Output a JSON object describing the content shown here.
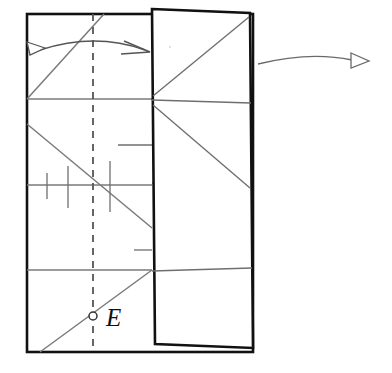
{
  "figure": {
    "type": "crease-pattern-fold-diagram",
    "background_color": "#ffffff",
    "line_color_heavy": "#111111",
    "line_color_light": "#7a7a7a",
    "arrow_color": "#555555"
  },
  "labels": {
    "point_E": "E"
  },
  "points": [
    {
      "name": "E",
      "label": "E",
      "marker": "open-circle",
      "x": 93,
      "y": 316,
      "radius": 4,
      "fill": "#ffffff",
      "stroke": "#333333",
      "label_x": 106,
      "label_y": 325
    }
  ],
  "shapes": {
    "main_rectangle": {
      "name": "base-sheet",
      "x": 27,
      "y": 14,
      "width": 226,
      "height": 338,
      "stroke_width": 2.6,
      "stroke": "#111111",
      "fill": "#ffffff"
    },
    "flap_panel": {
      "name": "folded-flap",
      "stroke_width": 2.6,
      "stroke": "#111111",
      "fill": "#ffffff",
      "corners": [
        {
          "x": 152,
          "y": 9
        },
        {
          "x": 250,
          "y": 13
        },
        {
          "x": 253,
          "y": 348
        },
        {
          "x": 155,
          "y": 344
        }
      ]
    }
  },
  "crease_lines": {
    "horizontal": [
      {
        "name": "crease-h1",
        "x1": 27,
        "y1": 99,
        "x2": 152,
        "y2": 99
      },
      {
        "name": "crease-h2",
        "x1": 27,
        "y1": 185,
        "x2": 152,
        "y2": 185
      },
      {
        "name": "crease-h3",
        "x1": 27,
        "y1": 270,
        "x2": 152,
        "y2": 270
      }
    ],
    "diagonals_left": [
      {
        "name": "crease-diag-up-top",
        "x1": 27,
        "y1": 99,
        "x2": 104,
        "y2": 14
      },
      {
        "name": "crease-diag-down-mid",
        "x1": 27,
        "y1": 124,
        "x2": 152,
        "y2": 228
      },
      {
        "name": "crease-diag-up-bottom",
        "x1": 40,
        "y1": 352,
        "x2": 152,
        "y2": 270
      }
    ],
    "diagonals_flap": [
      {
        "name": "flap-diag-1",
        "x1": 153,
        "y1": 96,
        "x2": 250,
        "y2": 16
      },
      {
        "name": "flap-diag-2",
        "x1": 153,
        "y1": 104,
        "x2": 251,
        "y2": 188
      },
      {
        "name": "flap-fold-h1",
        "x1": 152,
        "y1": 100,
        "x2": 251,
        "y2": 103
      },
      {
        "name": "flap-fold-h2",
        "x1": 152,
        "y1": 271,
        "x2": 252,
        "y2": 268
      }
    ],
    "tick_marks_vertical": [
      {
        "name": "tick-v1",
        "x": 47,
        "y1": 173,
        "y2": 199
      },
      {
        "name": "tick-v2",
        "x": 68,
        "y1": 166,
        "y2": 208
      },
      {
        "name": "tick-v3",
        "x": 110,
        "y1": 161,
        "y2": 212
      }
    ],
    "tick_marks_horizontal": [
      {
        "name": "tick-h1",
        "y": 145,
        "x1": 118,
        "x2": 152
      },
      {
        "name": "tick-h2",
        "y": 183,
        "x1": 152,
        "x2": 166
      },
      {
        "name": "tick-h3",
        "y": 250,
        "x1": 134,
        "x2": 152
      }
    ],
    "dashed_center": {
      "name": "center-fold-dashed",
      "x": 93,
      "y1": 14,
      "y2": 352,
      "dash": "7 6",
      "stroke": "#555555",
      "stroke_width": 1.8
    }
  },
  "arrows": [
    {
      "name": "fold-arrow-double",
      "style": "double-headed-curved",
      "head_left": "hollow-triangle",
      "head_right": "open-v",
      "path": "M 35,52 Q 95,33 148,52",
      "stroke": "#555555",
      "stroke_width": 1.3
    },
    {
      "name": "unfold-arrow-right",
      "style": "single-headed-curved",
      "head_right": "hollow-triangle",
      "path": "M 258,64 Q 310,52 358,60",
      "stroke": "#555555",
      "stroke_width": 1.3
    }
  ]
}
